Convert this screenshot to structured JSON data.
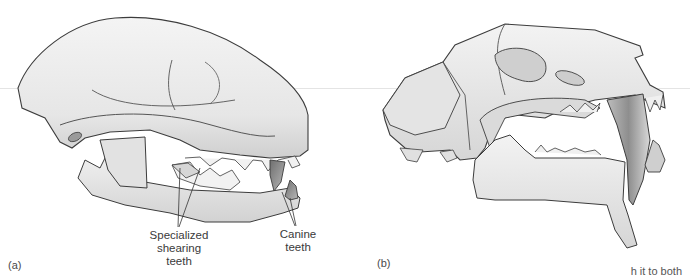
{
  "figure": {
    "panels": [
      {
        "id": "a",
        "tag": "(a)",
        "subject": "carnivore skull, lateral view",
        "labels": [
          {
            "text_line1": "Specialized",
            "text_line2": "shearing teeth"
          },
          {
            "text_line1": "Canine",
            "text_line2": "teeth"
          }
        ]
      },
      {
        "id": "b",
        "tag": "(b)",
        "subject": "saber-toothed cat skull, lateral view"
      }
    ],
    "bottom_bleed_text": "h it to both"
  },
  "colors": {
    "bone": "#e9e9e9",
    "bone_shadow": "#c4c4c4",
    "outline": "#3c3c3c",
    "tooth_dark": "#8a8a8a",
    "text": "#3a3a3a"
  }
}
